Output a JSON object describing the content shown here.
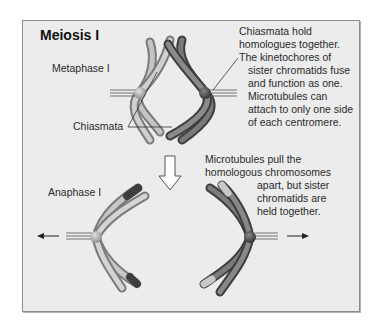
{
  "title": "Meiosis I",
  "stages": {
    "metaphase": "Metaphase I",
    "anaphase": "Anaphase I"
  },
  "labels": {
    "chiasmata": "Chiasmata"
  },
  "annotations": {
    "metaphase_note": [
      "Chiasmata hold",
      "homologues together.",
      "The kinetochores of",
      "sister chromatids fuse",
      "and function as one.",
      "Microtubules can",
      "attach to only one side",
      "of each centromere."
    ],
    "anaphase_note": [
      "Microtubules pull the",
      "homologous chromosomes",
      "apart, but sister",
      "chromatids are",
      "held together."
    ]
  },
  "icons": {
    "transition_arrow": "down-arrow",
    "pull_left": "left-arrow",
    "pull_right": "right-arrow"
  },
  "colors": {
    "panel": "#ececec",
    "light_chromosome": "#b9b9b9",
    "dark_chromosome": "#5c5c5c",
    "text": "#2a2a2a"
  }
}
